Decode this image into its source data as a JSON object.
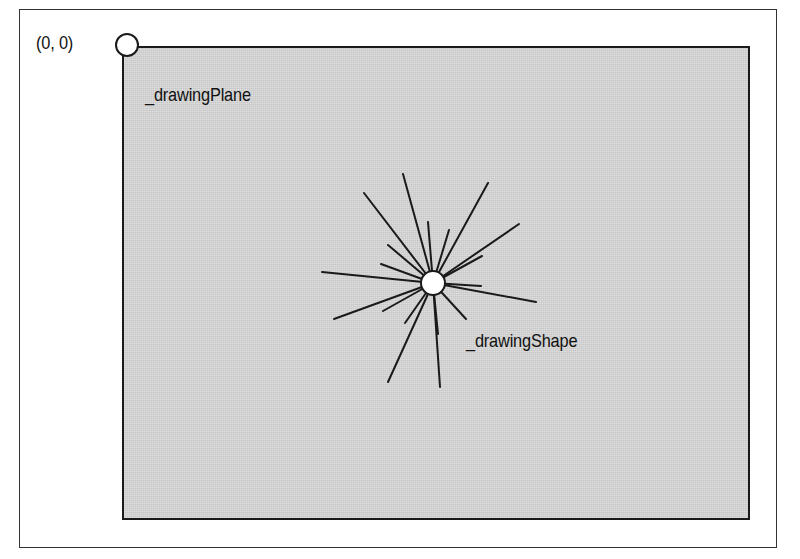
{
  "diagram": {
    "origin_label": "(0, 0)",
    "plane_label": "_drawingPlane",
    "shape_label": "_drawingShape",
    "colors": {
      "plane_fill": "#d6d6d6",
      "stroke": "#1a1a1a",
      "circle_fill": "#ffffff"
    },
    "origin_marker": {
      "cx": 127,
      "cy": 45,
      "r": 11
    },
    "shape_center": {
      "cx": 433,
      "cy": 283,
      "r": 12
    },
    "rays": [
      {
        "x2": 364,
        "y2": 193
      },
      {
        "x2": 403,
        "y2": 174
      },
      {
        "x2": 488,
        "y2": 183
      },
      {
        "x2": 519,
        "y2": 224
      },
      {
        "x2": 428,
        "y2": 222
      },
      {
        "x2": 449,
        "y2": 230
      },
      {
        "x2": 388,
        "y2": 245
      },
      {
        "x2": 381,
        "y2": 264
      },
      {
        "x2": 322,
        "y2": 272
      },
      {
        "x2": 482,
        "y2": 256
      },
      {
        "x2": 536,
        "y2": 302
      },
      {
        "x2": 481,
        "y2": 286
      },
      {
        "x2": 334,
        "y2": 319
      },
      {
        "x2": 383,
        "y2": 311
      },
      {
        "x2": 405,
        "y2": 323
      },
      {
        "x2": 466,
        "y2": 319
      },
      {
        "x2": 388,
        "y2": 382
      },
      {
        "x2": 440,
        "y2": 387
      },
      {
        "x2": 438,
        "y2": 334
      }
    ]
  }
}
